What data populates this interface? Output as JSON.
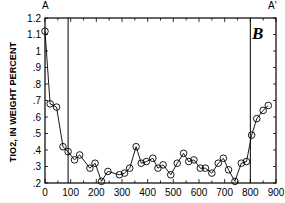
{
  "chart_data": {
    "type": "line",
    "title": "",
    "panel_label": "B",
    "corner_labels": {
      "left": "A",
      "right": "A'"
    },
    "xlabel": "",
    "ylabel": "TIO2, IN WEIGHT PERCENT",
    "xlim": [
      0,
      900
    ],
    "ylim": [
      0.2,
      1.2
    ],
    "x_ticks": [
      "0",
      "100",
      "200",
      "300",
      "400",
      "500",
      "600",
      "700",
      "800",
      "900"
    ],
    "y_ticks": [
      ".2",
      ".3",
      ".4",
      ".5",
      ".6",
      ".7",
      ".8",
      ".9",
      "1",
      "1.1",
      "1.2"
    ],
    "grid": false,
    "legend": null,
    "markers": "open circle",
    "vertical_lines": [
      90,
      800
    ],
    "series": [
      {
        "name": "TiO2",
        "x": [
          0,
          20,
          45,
          70,
          90,
          115,
          135,
          175,
          195,
          220,
          245,
          290,
          310,
          330,
          355,
          375,
          395,
          420,
          440,
          460,
          490,
          515,
          540,
          560,
          580,
          605,
          625,
          650,
          675,
          695,
          715,
          740,
          765,
          785,
          805,
          825,
          850,
          870
        ],
        "y": [
          1.12,
          0.68,
          0.66,
          0.42,
          0.39,
          0.34,
          0.37,
          0.29,
          0.32,
          0.21,
          0.27,
          0.25,
          0.26,
          0.29,
          0.42,
          0.32,
          0.33,
          0.35,
          0.29,
          0.31,
          0.25,
          0.32,
          0.38,
          0.33,
          0.34,
          0.29,
          0.29,
          0.26,
          0.32,
          0.35,
          0.28,
          0.21,
          0.32,
          0.33,
          0.49,
          0.59,
          0.64,
          0.67
        ]
      }
    ]
  }
}
